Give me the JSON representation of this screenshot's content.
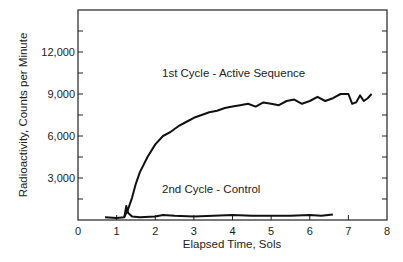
{
  "chart_data": {
    "type": "line",
    "title": "",
    "xlabel": "Elapsed Time, Sols",
    "ylabel": "Radioactivity, Counts per Minute",
    "xlim": [
      0,
      8
    ],
    "ylim": [
      0,
      15000
    ],
    "x_ticks": [
      "0",
      "1",
      "2",
      "3",
      "4",
      "5",
      "6",
      "7",
      "8"
    ],
    "y_ticks": [
      "3,000",
      "6,000",
      "9,000",
      "12,000"
    ],
    "grid": false,
    "legend": "none (inline annotations)",
    "annotations": [
      "1st Cycle - Active Sequence",
      "2nd Cycle - Control"
    ],
    "series": [
      {
        "name": "1st Cycle - Active Sequence",
        "x": [
          0.7,
          1.0,
          1.2,
          1.3,
          1.4,
          1.5,
          1.6,
          1.8,
          2.0,
          2.2,
          2.4,
          2.6,
          2.8,
          3.0,
          3.2,
          3.4,
          3.6,
          3.8,
          4.0,
          4.2,
          4.4,
          4.6,
          4.8,
          5.0,
          5.2,
          5.4,
          5.6,
          5.8,
          6.0,
          6.2,
          6.4,
          6.6,
          6.8,
          7.0,
          7.1,
          7.2,
          7.3,
          7.4,
          7.5,
          7.6
        ],
        "y": [
          200,
          150,
          200,
          800,
          1600,
          2600,
          3400,
          4500,
          5400,
          6000,
          6300,
          6700,
          7000,
          7300,
          7500,
          7700,
          7800,
          8000,
          8100,
          8200,
          8300,
          8100,
          8400,
          8300,
          8200,
          8500,
          8600,
          8300,
          8500,
          8800,
          8500,
          8700,
          9000,
          9000,
          8300,
          8400,
          8900,
          8500,
          8700,
          9000
        ]
      },
      {
        "name": "2nd Cycle - Control",
        "x": [
          1.2,
          1.25,
          1.3,
          1.4,
          1.6,
          2.0,
          2.2,
          2.5,
          3.0,
          3.5,
          4.0,
          4.5,
          5.0,
          5.5,
          6.0,
          6.3,
          6.6
        ],
        "y": [
          200,
          1000,
          500,
          250,
          200,
          250,
          350,
          300,
          250,
          300,
          350,
          300,
          300,
          300,
          350,
          300,
          400
        ]
      }
    ]
  }
}
